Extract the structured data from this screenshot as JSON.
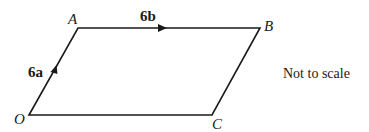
{
  "diagram": {
    "type": "parallelogram",
    "vertices": [
      {
        "name": "O",
        "x": 29,
        "y": 115
      },
      {
        "name": "A",
        "x": 78,
        "y": 28
      },
      {
        "name": "B",
        "x": 260,
        "y": 28
      },
      {
        "name": "C",
        "x": 212,
        "y": 115
      }
    ],
    "vertex_labels": {
      "O": "O",
      "A": "A",
      "B": "B",
      "C": "C"
    },
    "vectors": {
      "OA": {
        "label_num": "6",
        "label_vec": "a"
      },
      "AB": {
        "label_num": "6",
        "label_vec": "b"
      }
    },
    "note": "Not to scale",
    "line_color": "#1a1a1a"
  }
}
